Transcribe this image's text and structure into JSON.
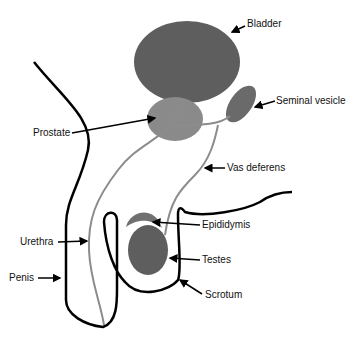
{
  "diagram": {
    "labels": {
      "bladder": "Bladder",
      "seminal_vesicle": "Seminal vesicle",
      "prostate": "Prostate",
      "vas_deferens": "Vas deferens",
      "epididymis": "Epididymis",
      "urethra": "Urethra",
      "testes": "Testes",
      "penis": "Penis",
      "scrotum": "Scrotum"
    },
    "colors": {
      "organ_dark": "#5e5e5e",
      "organ_light": "#8a8a8a",
      "duct": "#8c8c8c",
      "outline": "#000000"
    }
  }
}
